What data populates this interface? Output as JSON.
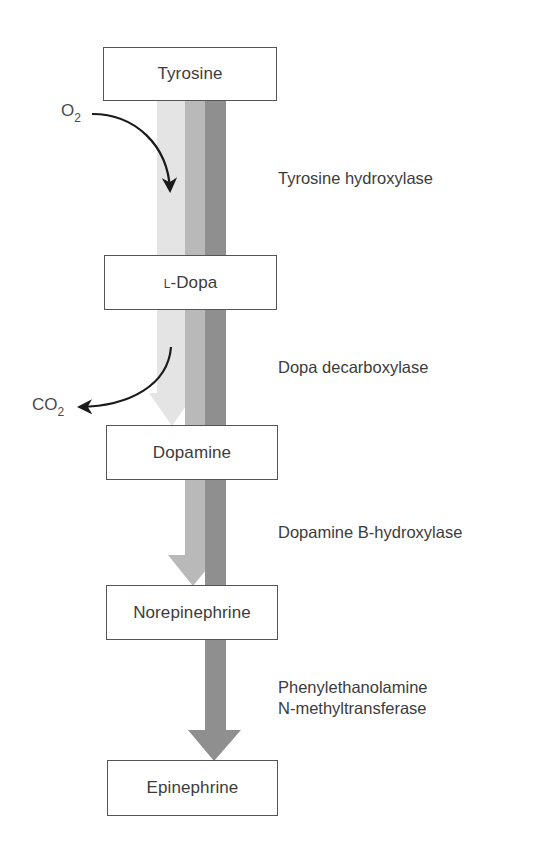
{
  "diagram": {
    "colors": {
      "light_stripe": "#e4e4e4",
      "medium_stripe": "#b9b9b9",
      "dark_stripe": "#8f8f8f",
      "box_border": "#555555",
      "text": "#3c3c3c",
      "curve_arrow": "#1a1a1a"
    },
    "compounds": [
      {
        "id": "tyrosine",
        "label": "Tyrosine"
      },
      {
        "id": "l-dopa",
        "prefix": "L",
        "label": "-Dopa"
      },
      {
        "id": "dopamine",
        "label": "Dopamine"
      },
      {
        "id": "norepinephrine",
        "label": "Norepinephrine"
      },
      {
        "id": "epinephrine",
        "label": "Epinephrine"
      }
    ],
    "enzymes": [
      {
        "id": "tyrosine-hydroxylase",
        "line1": "Tyrosine hydroxylase"
      },
      {
        "id": "dopa-decarboxylase",
        "line1": "Dopa decarboxylase"
      },
      {
        "id": "dopamine-b-hydroxylase",
        "line1": "Dopamine B-hydroxylase"
      },
      {
        "id": "pnmt",
        "line1": "Phenylethanolamine",
        "line2": "N-methyltransferase"
      }
    ],
    "cofactors": {
      "o2": {
        "base": "O",
        "sub": "2",
        "direction": "in"
      },
      "co2": {
        "base": "CO",
        "sub": "2",
        "direction": "out"
      }
    },
    "pathway_arrows": [
      {
        "name": "light-arrow",
        "ends_at": "Dopamine"
      },
      {
        "name": "medium-arrow",
        "ends_at": "Norepinephrine"
      },
      {
        "name": "dark-arrow",
        "ends_at": "Epinephrine"
      }
    ]
  }
}
